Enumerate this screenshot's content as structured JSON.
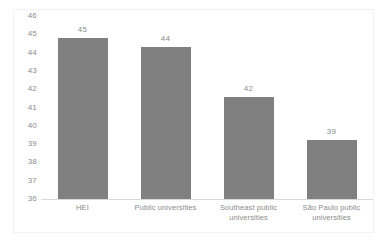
{
  "chart_data": {
    "type": "bar",
    "title": "",
    "subtitle": "",
    "xlabel": "",
    "ylabel": "",
    "categories": [
      "HEI",
      "Public universities",
      "Southeast public universities",
      "São Paulo public universities"
    ],
    "values": [
      45,
      44,
      42,
      39
    ],
    "bar_tops": [
      44.8,
      44.3,
      41.6,
      39.2
    ],
    "data_labels": [
      "45",
      "44",
      "42",
      "39"
    ],
    "ylim": [
      36,
      46
    ],
    "ytick_step": 1,
    "yticks": [
      "46",
      "45",
      "44",
      "43",
      "42",
      "41",
      "40",
      "39",
      "38",
      "37",
      "36"
    ],
    "grid": false,
    "legend": false,
    "legend_position": "none",
    "series": [
      {
        "name": "",
        "values": [
          45,
          44,
          42,
          39
        ]
      }
    ],
    "colors": {
      "bar": "#808080",
      "axis_line": "#d9d9d9",
      "tick_text": "#8c8c8c",
      "frame": "#f2f2f2",
      "background": "#ffffff"
    }
  }
}
